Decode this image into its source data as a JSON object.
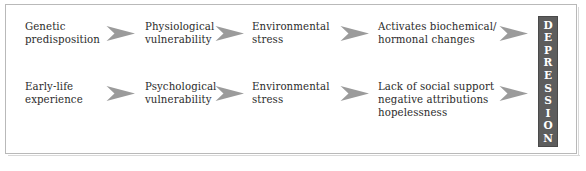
{
  "figure": {
    "frame_border_color": "#b9b9b9",
    "background_color": "#ffffff",
    "text_color": "#2b2b2b",
    "arrow_color": "#9b9b9b",
    "outcome_box_color": "#5d5d5d",
    "outcome_text_color": "#ffffff"
  },
  "rows": [
    {
      "id": "biological-pathway",
      "stages": [
        {
          "name": "genetic-predisposition",
          "lines": [
            "Genetic",
            "predisposition"
          ]
        },
        {
          "name": "physiological-vulnerability",
          "lines": [
            "Physiological",
            "vulnerability"
          ]
        },
        {
          "name": "environmental-stress",
          "lines": [
            "Environmental",
            "stress"
          ]
        },
        {
          "name": "activates-biochemical-hormonal-changes",
          "lines": [
            "Activates biochemical/",
            "hormonal changes"
          ]
        }
      ]
    },
    {
      "id": "psychosocial-pathway",
      "stages": [
        {
          "name": "early-life-experience",
          "lines": [
            "Early-life",
            "experience"
          ]
        },
        {
          "name": "psychological-vulnerability",
          "lines": [
            "Psychological",
            "vulnerability"
          ]
        },
        {
          "name": "environmental-stress",
          "lines": [
            "Environmental",
            "stress"
          ]
        },
        {
          "name": "lack-of-social-support",
          "lines": [
            "Lack of social support",
            "negative attributions",
            "hopelessness"
          ]
        }
      ]
    }
  ],
  "arrows": {
    "icon": "arrow-right-chevron",
    "count_per_row": 4
  },
  "outcome": {
    "label": "DEPRESSION",
    "letters": [
      "D",
      "E",
      "P",
      "R",
      "E",
      "S",
      "S",
      "I",
      "O",
      "N"
    ],
    "orientation": "vertical"
  }
}
